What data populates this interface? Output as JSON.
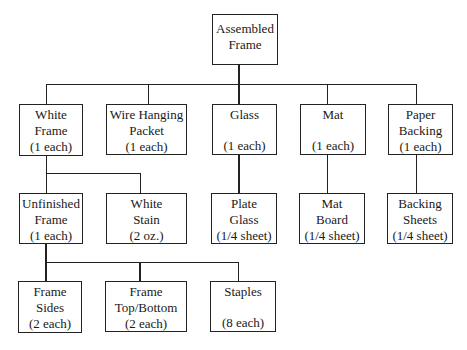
{
  "diagram": {
    "type": "bill-of-materials-tree",
    "root": {
      "id": "assembled-frame",
      "lines": [
        "Assembled",
        "Frame",
        ""
      ]
    },
    "nodes": {
      "white_frame": {
        "lines": [
          "White",
          "Frame",
          "(1 each)"
        ]
      },
      "wire_hanging_packet": {
        "lines": [
          "Wire Hanging",
          "Packet",
          "(1 each)"
        ]
      },
      "glass": {
        "lines": [
          "Glass",
          "",
          "(1 each)"
        ]
      },
      "mat": {
        "lines": [
          "Mat",
          "",
          "(1 each)"
        ]
      },
      "paper_backing": {
        "lines": [
          "Paper",
          "Backing",
          "(1 each)"
        ]
      },
      "unfinished_frame": {
        "lines": [
          "Unfinished",
          "Frame",
          "(1 each)"
        ]
      },
      "white_stain": {
        "lines": [
          "White",
          "Stain",
          "(2 oz.)"
        ]
      },
      "plate_glass": {
        "lines": [
          "Plate",
          "Glass",
          "(1/4 sheet)"
        ]
      },
      "mat_board": {
        "lines": [
          "Mat",
          "Board",
          "(1/4 sheet)"
        ]
      },
      "backing_sheets": {
        "lines": [
          "Backing",
          "Sheets",
          "(1/4 sheet)"
        ]
      },
      "frame_sides": {
        "lines": [
          "Frame",
          "Sides",
          "(2 each)"
        ]
      },
      "frame_top_bottom": {
        "lines": [
          "Frame",
          "Top/Bottom",
          "(2 each)"
        ]
      },
      "staples": {
        "lines": [
          "Staples",
          "",
          "(8 each)"
        ]
      }
    },
    "edges": [
      [
        "assembled-frame",
        "white_frame"
      ],
      [
        "assembled-frame",
        "wire_hanging_packet"
      ],
      [
        "assembled-frame",
        "glass"
      ],
      [
        "assembled-frame",
        "mat"
      ],
      [
        "assembled-frame",
        "paper_backing"
      ],
      [
        "white_frame",
        "unfinished_frame"
      ],
      [
        "white_frame",
        "white_stain"
      ],
      [
        "glass",
        "plate_glass"
      ],
      [
        "mat",
        "mat_board"
      ],
      [
        "paper_backing",
        "backing_sheets"
      ],
      [
        "unfinished_frame",
        "frame_sides"
      ],
      [
        "unfinished_frame",
        "frame_top_bottom"
      ],
      [
        "unfinished_frame",
        "staples"
      ]
    ]
  }
}
